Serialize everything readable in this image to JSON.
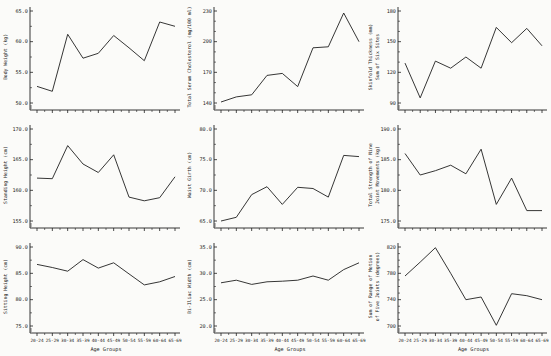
{
  "figure": {
    "background": "#fbfbf9",
    "ink": "#1f1f1f"
  },
  "x_axis": {
    "label": "Age Groups",
    "categories": [
      "20-24",
      "25-29",
      "30-34",
      "35-39",
      "40-44",
      "45-49",
      "50-54",
      "55-59",
      "60-64",
      "65-69"
    ]
  },
  "chart_data": [
    {
      "type": "line",
      "name": "body-weight",
      "ylabel_lines": [
        "Body Weight (kg)"
      ],
      "xlabel": "Age Groups",
      "show_x_labels": false,
      "categories": [
        "20-24",
        "25-29",
        "30-34",
        "35-39",
        "40-44",
        "45-49",
        "50-54",
        "55-59",
        "60-64",
        "65-69"
      ],
      "values": [
        52.7,
        51.9,
        61.2,
        57.3,
        58.1,
        61.0,
        59.0,
        56.9,
        63.2,
        62.5
      ],
      "yticks": [
        50,
        55,
        60,
        65
      ],
      "ytick_labels": [
        "50.0",
        "55.0",
        "60.0",
        "65.0"
      ],
      "yminor_per_gap": 1,
      "ylim": [
        50,
        65
      ]
    },
    {
      "type": "line",
      "name": "total-serum-cholesterol",
      "ylabel_lines": [
        "Total Serum Cholesterol (mg/100 ml)"
      ],
      "xlabel": "Age Groups",
      "show_x_labels": false,
      "categories": [
        "20-24",
        "25-29",
        "30-34",
        "35-39",
        "40-44",
        "45-49",
        "50-54",
        "55-59",
        "60-64",
        "65-69"
      ],
      "values": [
        141,
        146,
        148,
        167,
        169,
        156,
        194,
        195,
        228,
        200
      ],
      "yticks": [
        140,
        170,
        200,
        230
      ],
      "ytick_labels": [
        "140",
        "170",
        "200",
        "230"
      ],
      "yminor_per_gap": 2,
      "ylim": [
        140,
        230
      ]
    },
    {
      "type": "line",
      "name": "skinfold-thickness",
      "ylabel_lines": [
        "Skinfold Thickness (mm)",
        "Sum of Six Sites"
      ],
      "xlabel": "Age Groups",
      "show_x_labels": false,
      "categories": [
        "20-24",
        "25-29",
        "30-34",
        "35-39",
        "40-44",
        "45-49",
        "50-54",
        "55-59",
        "60-64",
        "65-69"
      ],
      "values": [
        129,
        95,
        131,
        124,
        135,
        124,
        164,
        149,
        163,
        146
      ],
      "yticks": [
        90,
        120,
        150,
        180
      ],
      "ytick_labels": [
        "90",
        "120",
        "150",
        "180"
      ],
      "yminor_per_gap": 2,
      "ylim": [
        90,
        180
      ]
    },
    {
      "type": "line",
      "name": "standing-height",
      "ylabel_lines": [
        "Standing Height (cm)"
      ],
      "xlabel": "Age Groups",
      "show_x_labels": false,
      "categories": [
        "20-24",
        "25-29",
        "30-34",
        "35-39",
        "40-44",
        "45-49",
        "50-54",
        "55-59",
        "60-64",
        "65-69"
      ],
      "values": [
        162.0,
        161.9,
        167.3,
        164.3,
        162.9,
        165.8,
        158.9,
        158.3,
        158.8,
        162.2
      ],
      "yticks": [
        155,
        160,
        165,
        170
      ],
      "ytick_labels": [
        "155.0",
        "160.0",
        "165.0",
        "170.0"
      ],
      "yminor_per_gap": 1,
      "ylim": [
        155,
        170
      ]
    },
    {
      "type": "line",
      "name": "waist-girth",
      "ylabel_lines": [
        "Waist Girth (cm)"
      ],
      "xlabel": "Age Groups",
      "show_x_labels": false,
      "categories": [
        "20-24",
        "25-29",
        "30-34",
        "35-39",
        "40-44",
        "45-49",
        "50-54",
        "55-59",
        "60-64",
        "65-69"
      ],
      "values": [
        65.0,
        65.6,
        69.3,
        70.6,
        67.7,
        70.5,
        70.3,
        68.9,
        75.7,
        75.5
      ],
      "yticks": [
        65,
        70,
        75,
        80
      ],
      "ytick_labels": [
        "65.0",
        "70.0",
        "75.0",
        "80.0"
      ],
      "yminor_per_gap": 1,
      "ylim": [
        65,
        80
      ]
    },
    {
      "type": "line",
      "name": "total-strength-nine-joint-movements",
      "ylabel_lines": [
        "Total Strength of Nine",
        "Joint Movements (kg)"
      ],
      "xlabel": "Age Groups",
      "show_x_labels": false,
      "categories": [
        "20-24",
        "25-29",
        "30-34",
        "35-39",
        "40-44",
        "45-49",
        "50-54",
        "55-59",
        "60-64",
        "65-69"
      ],
      "values": [
        186.0,
        182.5,
        183.2,
        184.1,
        182.7,
        186.7,
        177.7,
        182.0,
        176.7,
        176.7
      ],
      "yticks": [
        175,
        180,
        185,
        190
      ],
      "ytick_labels": [
        "175.0",
        "180.0",
        "185.0",
        "190.0"
      ],
      "yminor_per_gap": 1,
      "ylim": [
        175,
        190
      ]
    },
    {
      "type": "line",
      "name": "sitting-height",
      "ylabel_lines": [
        "Sitting Height (cm)"
      ],
      "xlabel": "Age Groups",
      "show_x_labels": true,
      "categories": [
        "20-24",
        "25-29",
        "30-34",
        "35-39",
        "40-44",
        "45-49",
        "50-54",
        "55-59",
        "60-64",
        "65-69"
      ],
      "values": [
        86.7,
        86.1,
        85.4,
        87.6,
        86.0,
        87.0,
        84.9,
        82.8,
        83.4,
        84.4
      ],
      "yticks": [
        75,
        80,
        85,
        90
      ],
      "ytick_labels": [
        "75.0",
        "80.0",
        "85.0",
        "90.0"
      ],
      "yminor_per_gap": 1,
      "ylim": [
        75,
        90
      ]
    },
    {
      "type": "line",
      "name": "bi-iliac-width",
      "ylabel_lines": [
        "Bi-Iliac Width (cm)"
      ],
      "xlabel": "Age Groups",
      "show_x_labels": true,
      "categories": [
        "20-24",
        "25-29",
        "30-34",
        "35-39",
        "40-44",
        "45-49",
        "50-54",
        "55-59",
        "60-64",
        "65-69"
      ],
      "values": [
        28.2,
        28.7,
        27.9,
        28.4,
        28.5,
        28.7,
        29.5,
        28.7,
        30.7,
        32.0
      ],
      "yticks": [
        20,
        25,
        30,
        35
      ],
      "ytick_labels": [
        "20.0",
        "25.0",
        "30.0",
        "35.0"
      ],
      "yminor_per_gap": 1,
      "ylim": [
        20,
        35
      ]
    },
    {
      "type": "line",
      "name": "sum-range-of-motion-five-joints",
      "ylabel_lines": [
        "Sum of Range of Motion",
        "of Five Joints (degrees)"
      ],
      "xlabel": "Age Groups",
      "show_x_labels": true,
      "categories": [
        "20-24",
        "25-29",
        "30-34",
        "35-39",
        "40-44",
        "45-49",
        "50-54",
        "55-59",
        "60-64",
        "65-69"
      ],
      "values": [
        776,
        797,
        819,
        780,
        740,
        744,
        701,
        749,
        746,
        740
      ],
      "yticks": [
        700,
        740,
        780,
        820
      ],
      "ytick_labels": [
        "700",
        "740",
        "780",
        "820"
      ],
      "yminor_per_gap": 3,
      "ylim": [
        700,
        820
      ]
    }
  ]
}
